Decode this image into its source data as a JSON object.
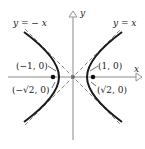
{
  "diagram": {
    "type": "hyperbola",
    "equation_implied": "x^2 - y^2 = 1",
    "axes": {
      "x_label": "x",
      "y_label": "y"
    },
    "asymptotes": [
      {
        "label": "y = − x",
        "slope": -1
      },
      {
        "label": "y = x",
        "slope": 1
      }
    ],
    "points": {
      "vertex_left": "(−1, 0)",
      "vertex_right": "(1, 0)",
      "focus_left": "(−√2, 0)",
      "focus_right": "(√2, 0)"
    },
    "colors": {
      "curve": "#1a1a1a",
      "axis": "#888888",
      "asymptote": "#777777"
    }
  }
}
